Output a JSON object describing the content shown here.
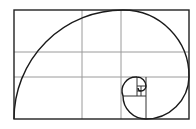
{
  "diagram": {
    "title": "",
    "type": "golden-ratio-spiral-with-thirds-grid",
    "colors": {
      "background": "#ffffff",
      "grid": "#9a9a9a",
      "frame": "#222222",
      "spiral": "#1a1a1a"
    },
    "frame": {
      "x": 14,
      "y": 10,
      "w": 175,
      "h": 109
    },
    "grid": {
      "vertical_x": [
        72,
        82,
        121
      ],
      "horizontal_y": [
        52,
        77
      ]
    }
  }
}
